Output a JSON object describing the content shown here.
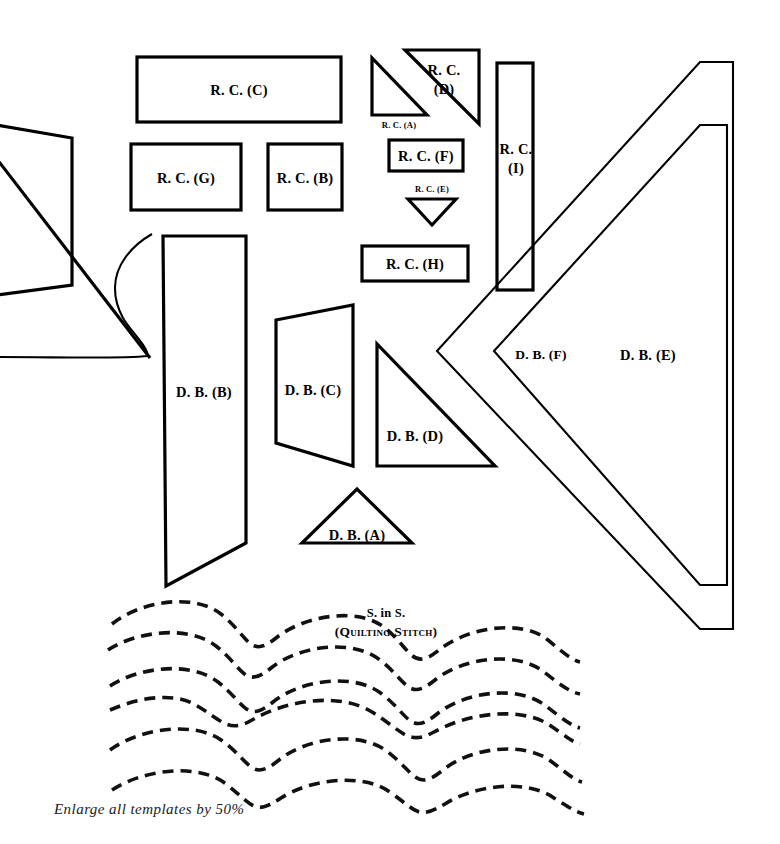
{
  "sheet": {
    "width": 780,
    "height": 844,
    "background_color": "#ffffff",
    "ink_color": "#000000",
    "caption": "Enlarge all templates by 50%"
  },
  "stitch_label": {
    "line1": "S. in S.",
    "line2": "(Quilting Stitch)"
  },
  "templates": [
    {
      "id": "rc-c",
      "label": "R. C. (C)",
      "shape": "rectangle",
      "label_x": 233,
      "label_y": 94,
      "size": "lg"
    },
    {
      "id": "rc-g",
      "label": "R. C. (G)",
      "shape": "rectangle",
      "label_x": 186,
      "label_y": 177,
      "size": "lg"
    },
    {
      "id": "rc-b",
      "label": "R. C. (B)",
      "shape": "square",
      "label_x": 305,
      "label_y": 177,
      "size": "lg"
    },
    {
      "id": "rc-a",
      "label": "R. C. (A)",
      "shape": "right-triangle",
      "label_x": 398,
      "label_y": 126,
      "size": "sm"
    },
    {
      "id": "rc-d",
      "label": "R. C.\n(D)",
      "line1": "R. C.",
      "line2": "(D)",
      "shape": "right-triangle",
      "label_x": 444,
      "label_y": 78,
      "size": "lg"
    },
    {
      "id": "rc-f",
      "label": "R. C. (F)",
      "shape": "rectangle",
      "label_x": 425,
      "label_y": 155,
      "size": "lg"
    },
    {
      "id": "rc-e",
      "label": "R. C. (E)",
      "shape": "down-triangle",
      "label_x": 431,
      "label_y": 190,
      "size": "sm"
    },
    {
      "id": "rc-h",
      "label": "R. C. (H)",
      "shape": "rectangle",
      "label_x": 415,
      "label_y": 263,
      "size": "lg"
    },
    {
      "id": "rc-i",
      "line1": "R. C.",
      "line2": "(I)",
      "shape": "tall-rectangle",
      "label_x": 516,
      "label_y": 157,
      "size": "lg"
    },
    {
      "id": "db-b",
      "label": "D. B. (B)",
      "shape": "tall-quadrilateral",
      "label_x": 204,
      "label_y": 392,
      "size": "lg"
    },
    {
      "id": "db-c",
      "label": "D. B. (C)",
      "shape": "trapezoid",
      "label_x": 313,
      "label_y": 390,
      "size": "lg"
    },
    {
      "id": "db-d",
      "label": "D. B. (D)",
      "shape": "right-triangle",
      "label_x": 415,
      "label_y": 435,
      "size": "lg"
    },
    {
      "id": "db-a",
      "label": "D. B. (A)",
      "shape": "isoceles-triangle",
      "label_x": 357,
      "label_y": 534,
      "size": "lg"
    },
    {
      "id": "db-f",
      "label": "D. B. (F)",
      "shape": "chevron",
      "label_x": 541,
      "label_y": 355,
      "size": "lg"
    },
    {
      "id": "db-e",
      "label": "D. B. (E)",
      "shape": "chevron",
      "label_x": 648,
      "label_y": 355,
      "size": "lg"
    }
  ],
  "geometry": {
    "rc_c": "137,57 341,57 341,122 137,122",
    "rc_g": "131,144 241,144 241,210 131,210",
    "rc_b": "268,144 342,144 342,210 268,210",
    "rc_a": "372,58 372,115 427,115",
    "rc_d": "405,50 479,50 479,124",
    "rc_f": "389,140 463,140 463,171 389,171",
    "rc_e": "408,199 456,199 432,224",
    "rc_h": "362,246 468,246 468,281 362,281",
    "rc_i": "497,63 533,63 533,290 497,290",
    "db_b": "163,236 246,236 246,543 166,586",
    "db_c": "276,320 353,305 353,466 276,443",
    "db_d": "377,344 377,466 495,466",
    "db_a": "302,543 357,489 412,543",
    "db_e_outer": "437,351 700,62 733,62 733,629 700,629",
    "db_e_inner": "480,351 700,113 733,113 733,577 700,577",
    "db_f_outer": "494,351 700,120 727,120 727,585 700,585",
    "left_quad": "0,124 72,138 72,285 0,296",
    "left_diag_from": "0,152",
    "left_diag_to": "148,357",
    "left_curve": "0,355 135,352 145,300 110,240"
  },
  "quilting": {
    "dash_pattern": "11 7",
    "stroke_width": 3.6,
    "wave_rows": 6,
    "wave_amplitude": 52,
    "wave_period": 218,
    "x_start": 112,
    "x_end": 565,
    "y_rows": [
      621,
      655,
      690,
      724,
      758,
      792
    ]
  }
}
